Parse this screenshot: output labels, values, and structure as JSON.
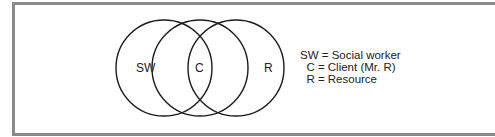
{
  "diagram": {
    "type": "venn",
    "circles": [
      {
        "id": "sw",
        "label": "SW",
        "cx": 164,
        "cy": 68,
        "r": 48
      },
      {
        "id": "c",
        "label": "C",
        "cx": 200,
        "cy": 68,
        "r": 48
      },
      {
        "id": "r",
        "label": "R",
        "cx": 236,
        "cy": 68,
        "r": 48
      }
    ],
    "labels": {
      "sw": "SW",
      "c": "C",
      "r": "R"
    },
    "stroke_color": "#1a1a1a",
    "frame_color": "#8a8a8a"
  },
  "legend": {
    "rows": [
      {
        "abbr": "SW",
        "text": "SW = Social worker"
      },
      {
        "abbr": "C",
        "text": "  C = Client (Mr. R)"
      },
      {
        "abbr": "R",
        "text": "  R = Resource"
      }
    ]
  }
}
